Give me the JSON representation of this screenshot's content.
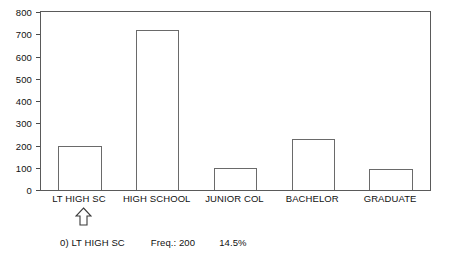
{
  "chart_data": {
    "type": "bar",
    "title": "",
    "subtitle": "",
    "xlabel": "",
    "ylabel": "",
    "categories": [
      "LT HIGH SC",
      "HIGH SCHOOL",
      "JUNIOR COL",
      "BACHELOR",
      "GRADUATE"
    ],
    "values": [
      200,
      720,
      100,
      230,
      95
    ],
    "ylim": [
      0,
      800
    ],
    "yticks": [
      0,
      100,
      200,
      300,
      400,
      500,
      600,
      700,
      800
    ],
    "ytick_labels": [
      "0",
      "100",
      "200",
      "300",
      "400",
      "500",
      "600",
      "700",
      "800"
    ],
    "grid": false,
    "legend": "none",
    "bar_fill": "#ffffff",
    "bar_outline": "#6a6a6a",
    "frame_color": "#5a5a5a"
  },
  "selection": {
    "marker_icon": "up-arrow-icon",
    "marker_category": "LT HIGH SC"
  },
  "status": {
    "index_label": "0) LT HIGH SC",
    "freq_label": "Freq.: 200",
    "percent_label": "14.5%"
  }
}
